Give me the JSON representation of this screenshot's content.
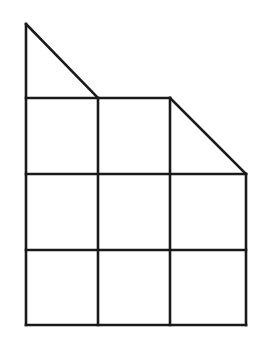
{
  "diagram": {
    "stroke_color": "#1a1a1a",
    "background_color": "#ffffff",
    "points": {
      "apex": [
        25,
        24
      ],
      "top_left_row": [
        26,
        98
      ],
      "grid_x": [
        26,
        98,
        170,
        246
      ],
      "grid_y": [
        98,
        174,
        250,
        325
      ],
      "right_slant_start": [
        170,
        98
      ],
      "right_slant_end": [
        246,
        174
      ]
    },
    "cells": {
      "rows": 3,
      "cols": 3
    },
    "shapes": [
      {
        "id": "top-left-triangle",
        "vertices": [
          [
            26,
            24
          ],
          [
            98,
            98
          ],
          [
            26,
            98
          ]
        ]
      },
      {
        "id": "top-right-triangle",
        "vertices": [
          [
            170,
            98
          ],
          [
            246,
            174
          ],
          [
            170,
            174
          ]
        ]
      }
    ]
  }
}
